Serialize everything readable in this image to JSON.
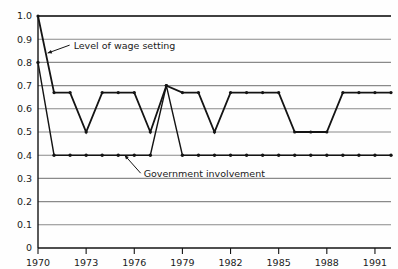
{
  "chart_data": {
    "type": "line",
    "title": "",
    "xlabel": "",
    "ylabel": "",
    "xlim": [
      1970,
      1992
    ],
    "ylim": [
      0,
      1.0
    ],
    "grid": true,
    "legend_position": "inline-annotations",
    "y_ticks": [
      "0",
      "0.1",
      "0.2",
      "0.3",
      "0.4",
      "0.5",
      "0.6",
      "0.7",
      "0.8",
      "0.9",
      "1.0"
    ],
    "y_tick_values": [
      0,
      0.1,
      0.2,
      0.3,
      0.4,
      0.5,
      0.6,
      0.7,
      0.8,
      0.9,
      1.0
    ],
    "x_ticks": [
      "1970",
      "1973",
      "1976",
      "1979",
      "1982",
      "1985",
      "1988",
      "1991"
    ],
    "x_tick_values": [
      1970,
      1973,
      1976,
      1979,
      1982,
      1985,
      1988,
      1991
    ],
    "x": [
      1970,
      1971,
      1972,
      1973,
      1974,
      1975,
      1976,
      1977,
      1978,
      1979,
      1980,
      1981,
      1982,
      1983,
      1984,
      1985,
      1986,
      1987,
      1988,
      1989,
      1990,
      1991,
      1992
    ],
    "series": [
      {
        "name": "Level of wage setting",
        "values": [
          1.0,
          0.67,
          0.67,
          0.5,
          0.67,
          0.67,
          0.67,
          0.5,
          0.7,
          0.67,
          0.67,
          0.5,
          0.67,
          0.67,
          0.67,
          0.67,
          0.5,
          0.5,
          0.5,
          0.67,
          0.67,
          0.67,
          0.67
        ]
      },
      {
        "name": "Government involvement",
        "values": [
          0.8,
          0.4,
          0.4,
          0.4,
          0.4,
          0.4,
          0.4,
          0.4,
          0.7,
          0.4,
          0.4,
          0.4,
          0.4,
          0.4,
          0.4,
          0.4,
          0.4,
          0.4,
          0.4,
          0.4,
          0.4,
          0.4,
          0.4
        ]
      }
    ],
    "annotations": [
      {
        "name": "wage-setting-annotation",
        "text": "Level of wage setting",
        "target_x": 1970.6,
        "target_y": 0.84
      },
      {
        "name": "government-involvement-annotation",
        "text": "Government involvement",
        "target_x": 1975.4,
        "target_y": 0.4
      }
    ]
  },
  "colors": {
    "line": "#141414",
    "grid": "#8a8a8a",
    "axis": "#141414",
    "background": "#fefefe",
    "text": "#1a1a1a"
  }
}
